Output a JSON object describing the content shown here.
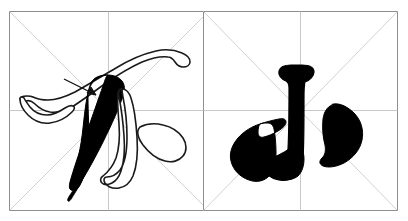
{
  "page": {
    "kind": "chinese-calligraphy-stroke-practice-sheet",
    "background_color": "#ffffff",
    "width": 408,
    "height": 221
  },
  "grid": {
    "style_name": "mi-zi-ge",
    "count": 2,
    "border_color": "#8e8e8e",
    "guide_color": "#c8c8c8",
    "diagonal_color": "#d2d2d2",
    "fill_color": "#ffffff",
    "border_width": 1,
    "guide_width": 1,
    "cells": [
      {
        "index": 0,
        "name": "left-cell",
        "x": 9,
        "y": 11,
        "size": 200,
        "has_vertical_guide": true,
        "has_horizontal_guide": true,
        "has_diagonals": true
      },
      {
        "index": 1,
        "name": "right-cell",
        "x": 203,
        "y": 11,
        "size": 195,
        "has_vertical_guide": true,
        "has_horizontal_guide": true,
        "has_diagonals": true
      }
    ]
  },
  "characters": [
    {
      "index": 0,
      "name": "character-bu",
      "glyph": "不",
      "pinyin": "bù",
      "cell": "left-cell",
      "render_mode": "mixed-outline-and-filled",
      "ink_color": "#000000",
      "outline_color": "#1a1a1a",
      "has_direction_arrow": true,
      "strokes": [
        {
          "name": "heng",
          "label": "横",
          "render": "outline"
        },
        {
          "name": "pie",
          "label": "撒",
          "render": "filled"
        },
        {
          "name": "shu",
          "label": "豎",
          "render": "outline"
        },
        {
          "name": "dian",
          "label": "点",
          "render": "outline"
        }
      ]
    },
    {
      "index": 1,
      "name": "character-xiao",
      "glyph": "小",
      "pinyin": "xiǎo",
      "cell": "right-cell",
      "render_mode": "filled",
      "ink_color": "#000000",
      "outline_color": "#000000",
      "has_direction_arrow": false,
      "strokes": [
        {
          "name": "shugou",
          "label": "豎钩",
          "render": "filled"
        },
        {
          "name": "zuodian",
          "label": "左点",
          "render": "filled"
        },
        {
          "name": "youdian",
          "label": "右点",
          "render": "filled"
        }
      ]
    }
  ]
}
